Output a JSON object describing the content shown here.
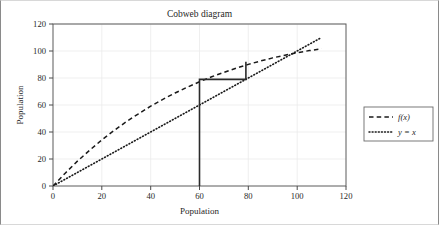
{
  "chart_data": {
    "type": "line",
    "title": "Cobweb diagram",
    "xlabel": "Population",
    "ylabel": "Population",
    "xlim": [
      0,
      120
    ],
    "ylim": [
      0,
      120
    ],
    "xticks": [
      0,
      20,
      40,
      60,
      80,
      100,
      120
    ],
    "yticks": [
      0,
      20,
      40,
      60,
      80,
      100,
      120
    ],
    "xtick_labels": [
      "0",
      "20",
      "40",
      "60",
      "80",
      "100",
      "120"
    ],
    "ytick_labels": [
      "0",
      "20",
      "40",
      "60",
      "80",
      "100",
      "120"
    ],
    "grid": true,
    "legend_position": "right-outside",
    "series": [
      {
        "name": "f(x)",
        "style": "dashed",
        "color": "#1a1a1a",
        "x": [
          0,
          5,
          10,
          15,
          20,
          25,
          30,
          35,
          40,
          45,
          50,
          55,
          60,
          65,
          70,
          75,
          80,
          85,
          90,
          95,
          100,
          105,
          110
        ],
        "y": [
          0,
          9.5,
          18.4,
          26.5,
          34.1,
          41.1,
          47.6,
          53.5,
          59.1,
          64.2,
          68.9,
          73.2,
          77.2,
          80.9,
          84.2,
          87.3,
          90.1,
          92.6,
          94.9,
          96.9,
          98.7,
          100.3,
          101.6
        ]
      },
      {
        "name": "y = x",
        "style": "dotted",
        "color": "#1a1a1a",
        "x": [
          0,
          110
        ],
        "y": [
          0,
          110
        ]
      },
      {
        "name": "cobweb",
        "style": "solid",
        "color": "#2b2b2b",
        "x": [
          60,
          60,
          79,
          79
        ],
        "y": [
          0,
          79,
          79,
          92
        ]
      }
    ],
    "legend": [
      {
        "label": "f(x)",
        "style": "dashed"
      },
      {
        "label": "y = x",
        "style": "dotted"
      }
    ]
  }
}
